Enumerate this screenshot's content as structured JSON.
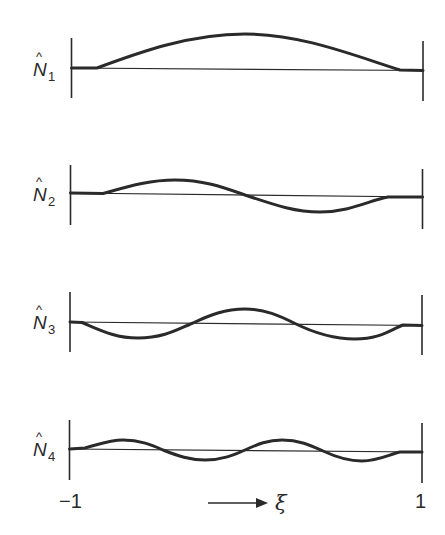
{
  "figure": {
    "colors": {
      "ink": "#2a2a2a",
      "background": "#ffffff"
    },
    "panels": [
      {
        "label": "N",
        "subscript": "1",
        "hat": "^",
        "description": "single hump"
      },
      {
        "label": "N",
        "subscript": "2",
        "hat": "^",
        "description": "one positive lobe, one negative lobe"
      },
      {
        "label": "N",
        "subscript": "3",
        "hat": "^",
        "description": "negative, positive, negative lobes"
      },
      {
        "label": "N",
        "subscript": "4",
        "hat": "^",
        "description": "positive, negative, positive, negative lobes"
      }
    ],
    "axis": {
      "left_tick": "−1",
      "right_tick": "1",
      "variable": "ξ",
      "arrow": "→"
    }
  }
}
